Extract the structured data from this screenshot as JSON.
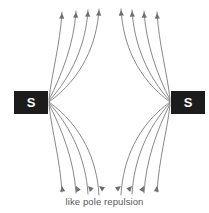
{
  "diagram": {
    "title": "like pole repulsion",
    "caption": "like pole repulsion",
    "background_color": "#ffffff",
    "field_line_color": "#7a7a7a",
    "magnet_color": "#1c1c1c",
    "magnet_label_color": "#ffffff",
    "caption_color": "#585858"
  },
  "magnets": [
    {
      "id": "left",
      "pole": "S",
      "pole_name": "south",
      "x": 14,
      "y": 91,
      "width": 34,
      "height": 23
    },
    {
      "id": "right",
      "pole": "S",
      "pole_name": "south",
      "x": 171,
      "y": 91,
      "width": 34,
      "height": 23
    }
  ],
  "field": {
    "line_count": 16,
    "arrow_direction": "up",
    "left_source": {
      "x": 49,
      "y": 102
    },
    "right_source": {
      "x": 170,
      "y": 102
    },
    "neutral_point": {
      "x": 104,
      "y": 102
    },
    "top_arrow_y": 14,
    "bottom_arrow_y": 185,
    "left_top_arrow_x": [
      62,
      76,
      88,
      99
    ],
    "right_top_arrow_x": [
      121,
      132,
      144,
      157
    ],
    "left_bottom_arrow_x": [
      62,
      76,
      88,
      99
    ],
    "right_bottom_arrow_x": [
      121,
      132,
      144,
      157
    ],
    "left_upper_lines": [
      {
        "start_x": 49,
        "start_y": 99,
        "c1x": 52,
        "c1y": 72,
        "c2x": 60,
        "c2y": 45,
        "end_x": 62,
        "end_y": 12,
        "arrow_x": 62,
        "arrow_y": 13
      },
      {
        "start_x": 49,
        "start_y": 100,
        "c1x": 62,
        "c1y": 74,
        "c2x": 74,
        "c2y": 44,
        "end_x": 76,
        "end_y": 11,
        "arrow_x": 76,
        "arrow_y": 12
      },
      {
        "start_x": 49,
        "start_y": 101,
        "c1x": 72,
        "c1y": 76,
        "c2x": 86,
        "c2y": 44,
        "end_x": 88,
        "end_y": 10,
        "arrow_x": 88,
        "arrow_y": 11
      },
      {
        "start_x": 49,
        "start_y": 102,
        "c1x": 82,
        "c1y": 78,
        "c2x": 97,
        "c2y": 44,
        "end_x": 99,
        "end_y": 9,
        "arrow_x": 99,
        "arrow_y": 10
      }
    ],
    "left_lower_lines": [
      {
        "start_x": 49,
        "start_y": 105,
        "c1x": 52,
        "c1y": 132,
        "c2x": 60,
        "c2y": 159,
        "end_x": 62,
        "end_y": 192,
        "arrow_x": 62,
        "arrow_y": 186
      },
      {
        "start_x": 49,
        "start_y": 104,
        "c1x": 62,
        "c1y": 130,
        "c2x": 74,
        "c2y": 160,
        "end_x": 76,
        "end_y": 193,
        "arrow_x": 76,
        "arrow_y": 186
      },
      {
        "start_x": 49,
        "start_y": 103,
        "c1x": 72,
        "c1y": 128,
        "c2x": 86,
        "c2y": 160,
        "end_x": 88,
        "end_y": 194,
        "arrow_x": 88,
        "arrow_y": 186
      },
      {
        "start_x": 49,
        "start_y": 102,
        "c1x": 82,
        "c1y": 126,
        "c2x": 97,
        "c2y": 160,
        "end_x": 99,
        "end_y": 195,
        "arrow_x": 99,
        "arrow_y": 186
      }
    ],
    "right_upper_lines": [
      {
        "start_x": 170,
        "start_y": 99,
        "c1x": 167,
        "c1y": 72,
        "c2x": 159,
        "c2y": 45,
        "end_x": 157,
        "end_y": 12,
        "arrow_x": 157,
        "arrow_y": 13
      },
      {
        "start_x": 170,
        "start_y": 100,
        "c1x": 157,
        "c1y": 74,
        "c2x": 146,
        "c2y": 44,
        "end_x": 144,
        "end_y": 11,
        "arrow_x": 144,
        "arrow_y": 12
      },
      {
        "start_x": 170,
        "start_y": 101,
        "c1x": 147,
        "c1y": 76,
        "c2x": 134,
        "c2y": 44,
        "end_x": 132,
        "end_y": 10,
        "arrow_x": 132,
        "arrow_y": 11
      },
      {
        "start_x": 170,
        "start_y": 102,
        "c1x": 137,
        "c1y": 78,
        "c2x": 123,
        "c2y": 44,
        "end_x": 121,
        "end_y": 9,
        "arrow_x": 121,
        "arrow_y": 10
      }
    ],
    "right_lower_lines": [
      {
        "start_x": 170,
        "start_y": 105,
        "c1x": 167,
        "c1y": 132,
        "c2x": 159,
        "c2y": 159,
        "end_x": 157,
        "end_y": 192,
        "arrow_x": 157,
        "arrow_y": 186
      },
      {
        "start_x": 170,
        "start_y": 104,
        "c1x": 157,
        "c1y": 130,
        "c2x": 146,
        "c2y": 160,
        "end_x": 144,
        "end_y": 193,
        "arrow_x": 144,
        "arrow_y": 186
      },
      {
        "start_x": 170,
        "start_y": 103,
        "c1x": 147,
        "c1y": 128,
        "c2x": 134,
        "c2y": 160,
        "end_x": 132,
        "end_y": 194,
        "arrow_x": 132,
        "arrow_y": 186
      },
      {
        "start_x": 170,
        "start_y": 102,
        "c1x": 137,
        "c1y": 126,
        "c2x": 123,
        "c2y": 160,
        "end_x": 121,
        "end_y": 195,
        "arrow_x": 121,
        "arrow_y": 186
      }
    ]
  }
}
